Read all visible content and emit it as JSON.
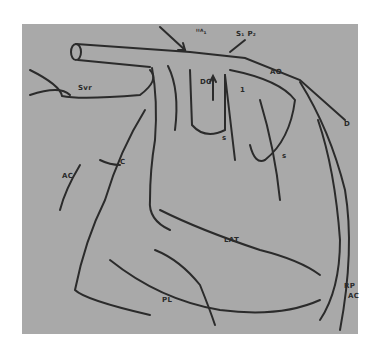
{
  "figure": {
    "background_color": "#a9a9a9",
    "line_color": "#2b2b2b",
    "labels": {
      "top_annotation_1": "ᴵᴵᴬ₁",
      "top_annotation_2": "S₁ P₂",
      "svr": "Svr",
      "ao": "AO",
      "dc": "DC",
      "arrow_num": "1",
      "s_center": "s",
      "s_lower": "s",
      "s_right": "s",
      "d": "D",
      "c": "C",
      "ac_left": "AC",
      "lat": "LAT",
      "pl": "PL",
      "rp": "RP",
      "ac_right": "AC"
    }
  }
}
